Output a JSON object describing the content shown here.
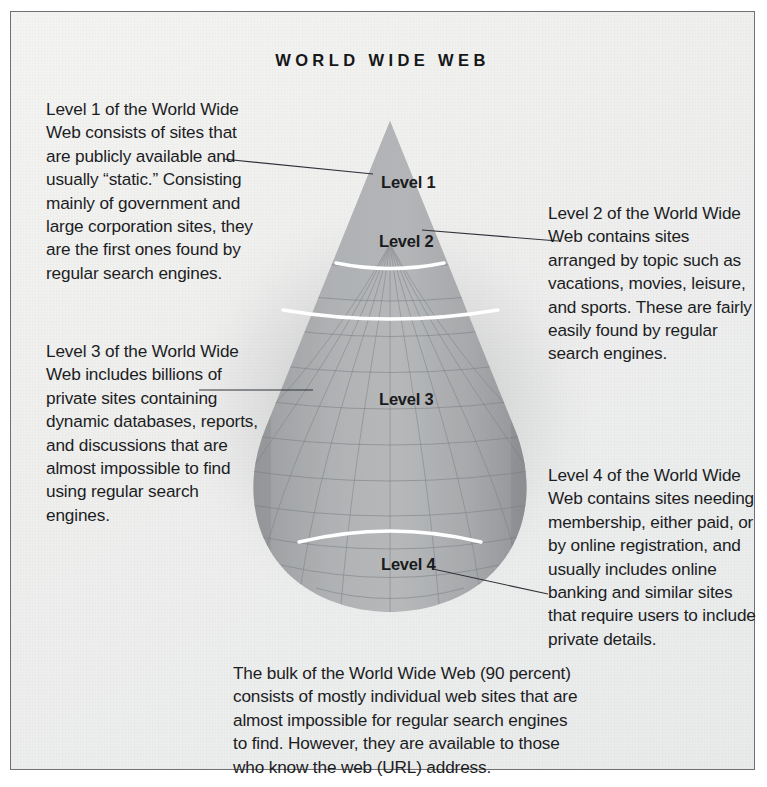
{
  "document": {
    "title": "WORLD WIDE WEB"
  },
  "diagram": {
    "shape": "teardrop-cone",
    "levels": [
      {
        "id": "level-1",
        "label": "Level 1"
      },
      {
        "id": "level-2",
        "label": "Level 2"
      },
      {
        "id": "level-3",
        "label": "Level 3"
      },
      {
        "id": "level-4",
        "label": "Level 4"
      }
    ]
  },
  "annotations": {
    "level_1": "Level 1 of the World Wide Web consists of sites that are publicly available and usually “static.” Consisting mainly of government and large corporation sites, they are the first ones found by regular search engines.",
    "level_2": "Level 2 of the World Wide Web contains sites arranged by topic such as vacations, movies, leisure, and sports. These are fairly easily found by regular search engines.",
    "level_3": "Level 3 of the World Wide Web includes billions of private sites containing dynamic databases, reports, and discussions that are almost impossible to find using regular search engines.",
    "level_4": "Level 4 of the World Wide Web contains sites needing membership, either paid, or by online registration, and usually includes online banking and similar sites that require users to include private details."
  },
  "caption": {
    "text": "The bulk of the World Wide Web (90 percent) consists of mostly individual web sites that are almost impossible for regular search engines to find. However, they are available to those who know the web (URL) address."
  },
  "colors": {
    "page_background": "#ffffff",
    "panel_background": "#efefee",
    "frame_border": "#6f7174",
    "text": "#1c1d1f",
    "title_text": "#161718",
    "shape_fill": "#9a9c9e",
    "shape_fill_light": "#b3b5b7",
    "divider_arc": "#ffffff",
    "mesh_line": "#7d8083",
    "leader_line": "#30333a"
  }
}
